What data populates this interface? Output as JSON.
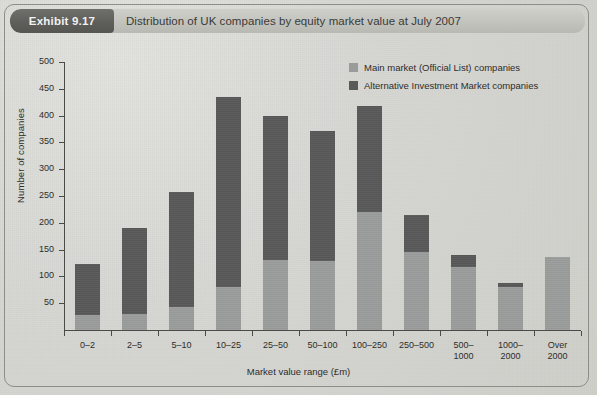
{
  "header": {
    "exhibit_tag": "Exhibit 9.17",
    "title": "Distribution of UK companies by equity market value at July 2007"
  },
  "legend": {
    "items": [
      {
        "label": "Main market (Official List) companies",
        "color": "#9a9c9b",
        "key": "main"
      },
      {
        "label": "Alternative Investment Market companies",
        "color": "#59595a",
        "key": "aim"
      }
    ]
  },
  "chart_data": {
    "type": "bar",
    "subtype": "stacked-vertical",
    "title": "Distribution of UK companies by equity market value at July 2007",
    "xlabel": "Market value range (£m)",
    "ylabel": "Number of companies",
    "ylim": [
      0,
      500
    ],
    "yticks": [
      0,
      50,
      100,
      150,
      200,
      250,
      300,
      350,
      400,
      450,
      500
    ],
    "ytick_labels": [
      "",
      "50",
      "100",
      "150",
      "200",
      "250",
      "300",
      "350",
      "400",
      "450",
      "500"
    ],
    "grid": false,
    "legend_position": "top-right",
    "categories": [
      "0–2",
      "2–5",
      "5–10",
      "10–25",
      "25–50",
      "50–100",
      "100–250",
      "250–500",
      "500–1000",
      "1000–2000",
      "Over 2000"
    ],
    "category_lines": [
      [
        "0–2"
      ],
      [
        "2–5"
      ],
      [
        "5–10"
      ],
      [
        "10–25"
      ],
      [
        "25–50"
      ],
      [
        "50–100"
      ],
      [
        "100–250"
      ],
      [
        "250–500"
      ],
      [
        "500–",
        "1000"
      ],
      [
        "1000–",
        "2000"
      ],
      [
        "Over",
        "2000"
      ]
    ],
    "series": [
      {
        "name": "Main market (Official List) companies",
        "color": "#9a9c9b",
        "values": [
          28,
          30,
          42,
          80,
          130,
          128,
          220,
          145,
          118,
          80,
          137
        ]
      },
      {
        "name": "Alternative Investment Market companies",
        "color": "#59595a",
        "values": [
          95,
          160,
          215,
          355,
          270,
          244,
          198,
          70,
          22,
          8,
          0
        ]
      }
    ],
    "totals": [
      123,
      190,
      257,
      435,
      400,
      372,
      418,
      215,
      140,
      88,
      137
    ]
  },
  "colors": {
    "page_background": "#d8d8d4",
    "header_bar": "#c3c3bd",
    "exhibit_tag": "#5d5d5a",
    "axis": "#4a4a47",
    "text": "#2d2d2b"
  }
}
